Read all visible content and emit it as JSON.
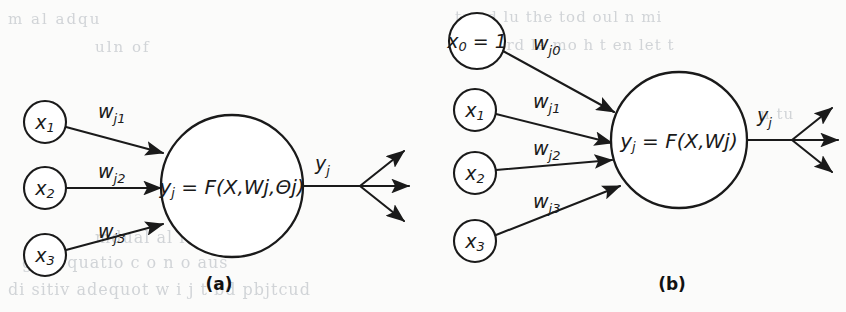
{
  "figure": {
    "background_color": "#fbfbfa",
    "ink_color": "#1a1a1a",
    "ghost_color": "#c3c7cc"
  },
  "panels": [
    {
      "id": "a",
      "caption": "(a)",
      "inputs": [
        {
          "name": "x1",
          "base": "x",
          "sub": "1"
        },
        {
          "name": "x2",
          "base": "x",
          "sub": "2"
        },
        {
          "name": "x3",
          "base": "x",
          "sub": "3"
        }
      ],
      "weights": [
        {
          "name": "wj1",
          "base": "w",
          "sub": "j1"
        },
        {
          "name": "wj2",
          "base": "w",
          "sub": "j2"
        },
        {
          "name": "wj3",
          "base": "w",
          "sub": "j3"
        }
      ],
      "body": {
        "out_base": "y",
        "out_sub": "j",
        "equals": " = ",
        "expression": "F(X,Wj,Θj)"
      },
      "output": {
        "name": "yj",
        "base": "y",
        "sub": "j"
      },
      "fan_out_arrows": 3
    },
    {
      "id": "b",
      "caption": "(b)",
      "inputs": [
        {
          "name": "x0",
          "base": "x",
          "sub": "0",
          "suffix": " = 1"
        },
        {
          "name": "x1",
          "base": "x",
          "sub": "1"
        },
        {
          "name": "x2",
          "base": "x",
          "sub": "2"
        },
        {
          "name": "x3",
          "base": "x",
          "sub": "3"
        }
      ],
      "weights": [
        {
          "name": "wj0",
          "base": "w",
          "sub": "j0"
        },
        {
          "name": "wj1",
          "base": "w",
          "sub": "j1"
        },
        {
          "name": "wj2",
          "base": "w",
          "sub": "j2"
        },
        {
          "name": "wj3",
          "base": "w",
          "sub": "j3"
        }
      ],
      "body": {
        "out_base": "y",
        "out_sub": "j",
        "equals": " = ",
        "expression": "F(X,Wj)"
      },
      "output": {
        "name": "yj",
        "base": "y",
        "sub": "j"
      },
      "fan_out_arrows": 3
    }
  ],
  "ghost_text": [
    {
      "text": "m  al     adqu",
      "left": 8,
      "top": 10,
      "size": 15,
      "spacing": 2
    },
    {
      "text": "ts  ud  lu  the tod   oul  n  mi",
      "left": 455,
      "top": 8,
      "size": 15,
      "spacing": 1
    },
    {
      "text": "uln        of",
      "left": 95,
      "top": 38,
      "size": 15,
      "spacing": 2
    },
    {
      "text": "t i ud  trd  le  mo h t  en  let  t",
      "left": 448,
      "top": 36,
      "size": 15,
      "spacing": 1
    },
    {
      "text": "n  tu",
      "left": 760,
      "top": 105,
      "size": 15,
      "spacing": 1
    },
    {
      "text": "mdual  al    it    a    i    n",
      "left": 95,
      "top": 228,
      "size": 16,
      "spacing": 1
    },
    {
      "text": "g  en  quatio   c  o  n   o    aus",
      "left": 22,
      "top": 253,
      "size": 16,
      "spacing": 1
    },
    {
      "text": "di   sitiv     adequot    w  i   j  t bd   pbjtcud",
      "left": 8,
      "top": 280,
      "size": 16,
      "spacing": 1
    }
  ]
}
